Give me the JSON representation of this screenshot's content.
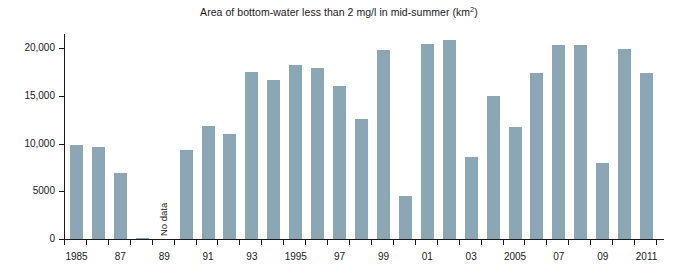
{
  "chart_data": {
    "type": "bar",
    "title": "Area of bottom-water less than 2 mg/l in mid-summer (km2)",
    "title_main": "Area of bottom-water less than 2 mg/l in mid-summer (km",
    "title_sup": "2",
    "title_tail": ")",
    "xlabel": "",
    "ylabel": "",
    "ylim": [
      0,
      21500
    ],
    "yticks": [
      0,
      5000,
      10000,
      15000,
      20000
    ],
    "ytick_labels": [
      "0",
      "5000",
      "10,000",
      "15,000",
      "20,000"
    ],
    "grid": false,
    "legend": null,
    "bar_color": "#8ba7b5",
    "axis_color": "#1a1a1a",
    "categories": [
      "1985",
      "1986",
      "1987",
      "1988",
      "1989",
      "1990",
      "1991",
      "1992",
      "1993",
      "1994",
      "1995",
      "1996",
      "1997",
      "1998",
      "1999",
      "2000",
      "2001",
      "2002",
      "2003",
      "2004",
      "2005",
      "2006",
      "2007",
      "2008",
      "2009",
      "2010",
      "2011"
    ],
    "values": [
      9900,
      9700,
      6900,
      150,
      null,
      9350,
      11900,
      11000,
      17500,
      16700,
      18300,
      17900,
      16000,
      12600,
      19800,
      4550,
      20500,
      20900,
      8600,
      15050,
      11700,
      17400,
      20400,
      20300,
      7950,
      19900,
      17400
    ],
    "xtick_labels": [
      {
        "category": "1985",
        "label": "1985"
      },
      {
        "category": "1987",
        "label": "87"
      },
      {
        "category": "1989",
        "label": "89"
      },
      {
        "category": "1991",
        "label": "91"
      },
      {
        "category": "1993",
        "label": "93"
      },
      {
        "category": "1995",
        "label": "1995"
      },
      {
        "category": "1997",
        "label": "97"
      },
      {
        "category": "1999",
        "label": "99"
      },
      {
        "category": "2001",
        "label": "01"
      },
      {
        "category": "2003",
        "label": "03"
      },
      {
        "category": "2005",
        "label": "2005"
      },
      {
        "category": "2007",
        "label": "07"
      },
      {
        "category": "2009",
        "label": "09"
      },
      {
        "category": "2011",
        "label": "2011"
      }
    ],
    "annotations": [
      {
        "name": "no-data-label",
        "category": "1989",
        "text": "No data",
        "rotation": -90
      }
    ]
  }
}
